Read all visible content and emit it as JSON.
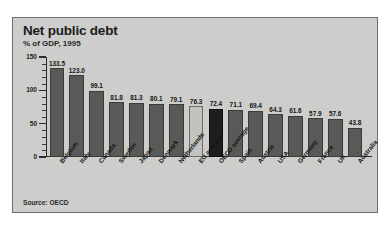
{
  "chart_data": {
    "type": "bar",
    "title": "Net public debt",
    "subtitle": "% of GDP, 1995",
    "xlabel": "",
    "ylabel": "",
    "ylim": [
      0,
      150
    ],
    "yticks": [
      0,
      50,
      100,
      150
    ],
    "ytick_labels": [
      "0",
      "50",
      "100",
      "150"
    ],
    "minor_tick_step": 10,
    "grid": false,
    "legend": "none",
    "source": "Source: OECD",
    "categories": [
      "Belgium",
      "Italy",
      "Canada",
      "Sweden",
      "Japan",
      "Denmark",
      "Netherlands",
      "EU average",
      "OECD average",
      "Spain",
      "Austria",
      "USA",
      "Germany",
      "France",
      "UK",
      "Australia"
    ],
    "values": [
      133.5,
      123.0,
      99.1,
      81.8,
      81.3,
      80.1,
      79.1,
      76.3,
      72.4,
      71.1,
      69.4,
      64.3,
      61.6,
      57.9,
      57.6,
      43.8
    ],
    "value_labels": [
      "133.5",
      "123.0",
      "99.1",
      "81.8",
      "81.3",
      "80.1",
      "79.1",
      "76.3",
      "72.4",
      "71.1",
      "69.4",
      "64.3",
      "61.6",
      "57.9",
      "57.6",
      "43.8"
    ],
    "bar_styles": [
      "normal",
      "normal",
      "normal",
      "normal",
      "normal",
      "normal",
      "normal",
      "light",
      "dark",
      "normal",
      "normal",
      "normal",
      "normal",
      "normal",
      "normal",
      "normal"
    ],
    "colors": {
      "bar": "#595957",
      "bar_light": "#c2c2be",
      "bar_dark": "#1e1e1e",
      "panel_background": "#cdcdcb",
      "axis": "#2b2b2b",
      "text": "#141414"
    }
  }
}
